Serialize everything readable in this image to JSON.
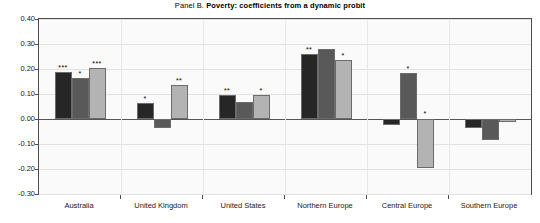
{
  "chart_data": {
    "type": "bar",
    "title_prefix": "Panel B.",
    "title_main": "Poverty: coefficients from a dynamic probit",
    "title": "Panel B. Poverty: coefficients from a dynamic probit",
    "xlabel": "",
    "ylabel": "",
    "ylim": [
      -0.3,
      0.4
    ],
    "ytick_step": 0.1,
    "ytick_labels": [
      "0.40",
      "0.30",
      "0.20",
      "0.10",
      "0.00",
      "-0.10",
      "-0.20",
      "-0.30"
    ],
    "ytick_values": [
      0.4,
      0.3,
      0.2,
      0.1,
      0.0,
      -0.1,
      -0.2,
      -0.3
    ],
    "grid": true,
    "legend": "none",
    "categories": [
      "Australia",
      "United Kingdom",
      "United States",
      "Northern Europe",
      "Central Europe",
      "Southern Europe"
    ],
    "series": [
      {
        "name": "series-1",
        "color": "#262626",
        "values": [
          0.19,
          0.065,
          0.095,
          0.26,
          -0.025,
          -0.035
        ],
        "significance": [
          "***",
          "*",
          "**",
          "**",
          "",
          ""
        ]
      },
      {
        "name": "series-2",
        "color": "#595959",
        "values": [
          0.165,
          -0.035,
          0.07,
          0.28,
          0.185,
          -0.085
        ],
        "significance": [
          "*",
          "",
          "",
          "",
          "*",
          ""
        ]
      },
      {
        "name": "series-3",
        "color": "#b3b3b3",
        "values": [
          0.205,
          0.135,
          0.095,
          0.235,
          -0.195,
          -0.01
        ],
        "significance": [
          "***",
          "**",
          "*",
          "*",
          "*",
          ""
        ]
      }
    ]
  }
}
